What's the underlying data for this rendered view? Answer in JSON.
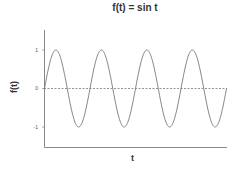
{
  "chart_data": {
    "type": "line",
    "title": "f(t) = sin t",
    "xlabel": "t",
    "ylabel": "f(t)",
    "yticks": [
      "1",
      "0",
      "-1"
    ],
    "ytick_values": [
      1,
      0,
      -1
    ],
    "xticks": [],
    "xlim": [
      0,
      25.13
    ],
    "ylim": [
      -1.5,
      1.5
    ],
    "grid": false,
    "legend": null,
    "series": [
      {
        "name": "sin t",
        "function": "sin(t)",
        "t_range": [
          0,
          25.13
        ],
        "style": "solid",
        "color": "#777777"
      },
      {
        "name": "zero line",
        "y": 0,
        "style": "dashed",
        "color": "#666666"
      }
    ],
    "x": [
      0,
      1.571,
      3.142,
      4.712,
      6.283,
      7.854,
      9.425,
      10.996,
      12.566,
      14.137,
      15.708,
      17.279,
      18.85,
      20.42,
      21.991,
      23.562,
      25.133
    ],
    "values": [
      0,
      1,
      0,
      -1,
      0,
      1,
      0,
      -1,
      0,
      1,
      0,
      -1,
      0,
      1,
      0,
      -1,
      0
    ]
  }
}
